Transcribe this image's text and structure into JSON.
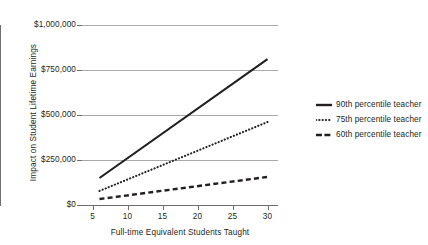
{
  "chart_data": {
    "type": "line",
    "title": "",
    "xlabel": "Full-time Equivalent Students Taught",
    "ylabel": "Impact on Student Lifetime Earnings",
    "xlim": [
      3.5,
      31.5
    ],
    "ylim": [
      0,
      1000000
    ],
    "grid": true,
    "legend_position": "right",
    "x_ticks": [
      5,
      10,
      15,
      20,
      25,
      30
    ],
    "x_tick_labels": [
      "5",
      "10",
      "15",
      "20",
      "25",
      "30"
    ],
    "y_ticks": [
      0,
      250000,
      500000,
      750000,
      1000000
    ],
    "y_tick_labels": [
      "$0",
      "$250,000",
      "$500,000",
      "$750,000",
      "$1,000,000"
    ],
    "x": [
      6,
      30
    ],
    "series": [
      {
        "name": "90th percentile teacher",
        "style": "solid",
        "color": "#231f20",
        "values": [
          150000,
          810000
        ]
      },
      {
        "name": "75th percentile teacher",
        "style": "dotted",
        "color": "#231f20",
        "values": [
          78000,
          461000
        ]
      },
      {
        "name": "60th percentile teacher",
        "style": "dashed",
        "color": "#231f20",
        "values": [
          33000,
          156000
        ]
      }
    ]
  },
  "legend": {
    "items": [
      {
        "label": "90th percentile teacher"
      },
      {
        "label": "75th percentile teacher"
      },
      {
        "label": "60th percentile teacher"
      }
    ]
  },
  "axes": {
    "y_title": "Impact on Student Lifetime Earnings",
    "x_title": "Full-time Equivalent Students Taught"
  }
}
